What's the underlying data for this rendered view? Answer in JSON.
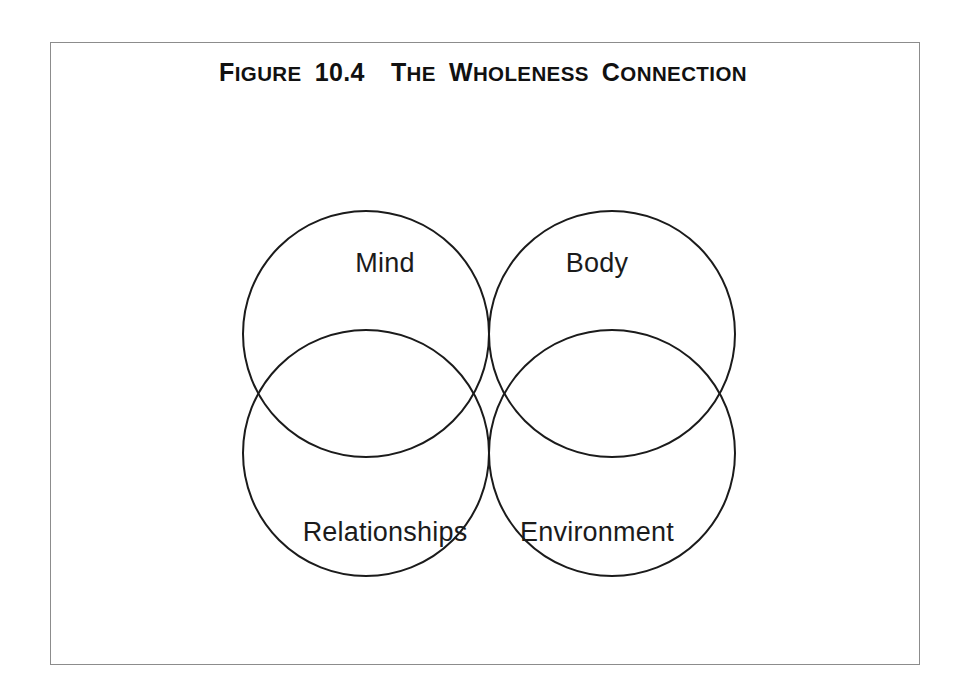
{
  "page": {
    "background_color": "#ffffff",
    "frame_color": "#8c8c8c"
  },
  "figure": {
    "number_label": "Figure",
    "number": "10.4",
    "title_text": "The Wholeness Connection",
    "title_full": "FIGURE 10.4  THE WHOLENESS CONNECTION",
    "title_parts": {
      "word1_cap": "F",
      "word1_rest": "IGURE",
      "number": "10.4",
      "word2_cap": "T",
      "word2_rest": "HE",
      "word3_cap": "W",
      "word3_rest": "HOLENESS",
      "word4_cap": "C",
      "word4_rest": "ONNECTION"
    }
  },
  "chart_data": {
    "type": "venn",
    "set_count": 4,
    "line_color": "#1b1b1b",
    "fill_color": "#ffffff",
    "intersection_fill": "#000000",
    "intersection_note": "Center region where all four circles overlap is filled solid black",
    "radius": 123,
    "sets": [
      {
        "id": "mind",
        "label": "Mind",
        "cx": 366,
        "cy": 334,
        "r": 123,
        "label_x": 385,
        "label_y": 272,
        "position": "upper-left"
      },
      {
        "id": "body",
        "label": "Body",
        "cx": 612,
        "cy": 334,
        "r": 123,
        "label_x": 597,
        "label_y": 272,
        "position": "upper-right"
      },
      {
        "id": "relationships",
        "label": "Relationships",
        "cx": 366,
        "cy": 453,
        "r": 123,
        "label_x": 385,
        "label_y": 541,
        "position": "lower-left"
      },
      {
        "id": "environment",
        "label": "Environment",
        "cx": 612,
        "cy": 453,
        "r": 123,
        "label_x": 597,
        "label_y": 541,
        "position": "lower-right"
      }
    ],
    "labels": [
      "Mind",
      "Body",
      "Relationships",
      "Environment"
    ]
  }
}
